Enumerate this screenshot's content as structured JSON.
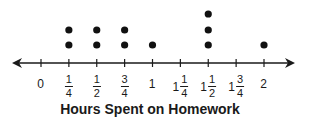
{
  "chart_data": {
    "type": "dot",
    "title": "",
    "xlabel": "Hours Spent on Homework",
    "ylabel": "",
    "xlim": [
      0,
      2
    ],
    "tick_step": 0.25,
    "ticks": [
      {
        "value": 0,
        "whole": "0",
        "num": "",
        "den": ""
      },
      {
        "value": 0.25,
        "whole": "",
        "num": "1",
        "den": "4"
      },
      {
        "value": 0.5,
        "whole": "",
        "num": "1",
        "den": "2"
      },
      {
        "value": 0.75,
        "whole": "",
        "num": "3",
        "den": "4"
      },
      {
        "value": 1,
        "whole": "1",
        "num": "",
        "den": ""
      },
      {
        "value": 1.25,
        "whole": "1",
        "num": "1",
        "den": "4"
      },
      {
        "value": 1.5,
        "whole": "1",
        "num": "1",
        "den": "2"
      },
      {
        "value": 1.75,
        "whole": "1",
        "num": "3",
        "den": "4"
      },
      {
        "value": 2,
        "whole": "2",
        "num": "",
        "den": ""
      }
    ],
    "categories": [
      "0",
      "1/4",
      "1/2",
      "3/4",
      "1",
      "1 1/4",
      "1 1/2",
      "1 3/4",
      "2"
    ],
    "values": [
      0,
      2,
      2,
      2,
      1,
      0,
      3,
      0,
      1
    ],
    "grid": false,
    "legend": null,
    "colors": {
      "dot": "#111111",
      "axis": "#1a1a1a"
    }
  }
}
